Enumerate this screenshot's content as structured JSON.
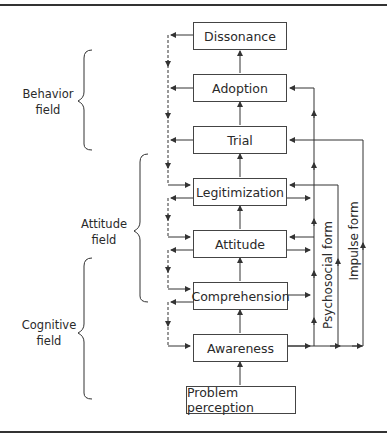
{
  "diagram": {
    "type": "flow",
    "stages": [
      {
        "id": "dissonance",
        "label": "Dissonance"
      },
      {
        "id": "adoption",
        "label": "Adoption"
      },
      {
        "id": "trial",
        "label": "Trial"
      },
      {
        "id": "legitimization",
        "label": "Legitimization"
      },
      {
        "id": "attitude",
        "label": "Attitude"
      },
      {
        "id": "comprehension",
        "label": "Comprehension"
      },
      {
        "id": "awareness",
        "label": "Awareness"
      },
      {
        "id": "problem_perception",
        "label": "Problem perception"
      }
    ],
    "fields": {
      "behavior": {
        "line1": "Behavior",
        "line2": "field"
      },
      "attitude": {
        "line1": "Attitude",
        "line2": "field"
      },
      "cognitive": {
        "line1": "Cognitive",
        "line2": "field"
      }
    },
    "paths": {
      "psychosocial": "Psychosocial form",
      "impulse": "Impulse form"
    },
    "colors": {
      "line": "#333333",
      "box_border": "#444444",
      "text": "#2a2a2a"
    }
  }
}
